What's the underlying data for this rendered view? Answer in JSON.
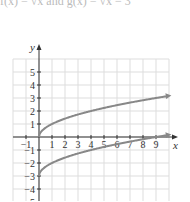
{
  "caption": "f(x) = √x and g(x) = √x − 3",
  "chart_data": {
    "type": "line",
    "title": "",
    "xlabel": "x",
    "ylabel": "y",
    "xlim": [
      -2,
      10
    ],
    "ylim": [
      -6,
      6
    ],
    "grid": true,
    "x_ticks": [
      "-1",
      "1",
      "2",
      "3",
      "4",
      "5",
      "6",
      "7",
      "8",
      "9"
    ],
    "y_ticks": [
      "5",
      "4",
      "3",
      "2",
      "1",
      "-1",
      "-2",
      "-3",
      "-4",
      "-5"
    ],
    "series": [
      {
        "name": "f(x) = √x",
        "x": [
          0,
          1,
          4,
          9,
          10
        ],
        "values": [
          0,
          1,
          2,
          3,
          3.16
        ]
      },
      {
        "name": "g(x) = √x − 3",
        "x": [
          0,
          1,
          4,
          9,
          10
        ],
        "values": [
          -3,
          -2,
          -1,
          0,
          0.16
        ]
      }
    ],
    "colors": {
      "curve": "#888888",
      "grid": "#dddddd",
      "axis": "#333333"
    }
  }
}
